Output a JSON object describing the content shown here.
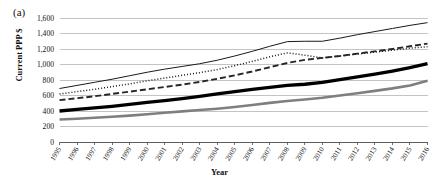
{
  "figure": {
    "panel_label": "(a)",
    "xlabel": "Year",
    "ylabel": "Current PPP $"
  },
  "chart_data": {
    "type": "line",
    "title": "",
    "subtitle": "",
    "panel": "(a)",
    "xlabel": "Year",
    "ylabel": "Current PPP $",
    "grid": true,
    "legend": "none",
    "xlim": [
      1995,
      2016
    ],
    "ylim": [
      0,
      1600
    ],
    "ytick_labels": [
      "0",
      "200",
      "400",
      "600",
      "800",
      "1,000",
      "1,200",
      "1,400",
      "1,600"
    ],
    "ytick_values": [
      0,
      200,
      400,
      600,
      800,
      1000,
      1200,
      1400,
      1600
    ],
    "x": [
      1995,
      1996,
      1997,
      1998,
      1999,
      2000,
      2001,
      2002,
      2003,
      2004,
      2005,
      2006,
      2007,
      2008,
      2009,
      2010,
      2011,
      2012,
      2013,
      2014,
      2015,
      2016
    ],
    "categories": [
      "1995",
      "1996",
      "1997",
      "1998",
      "1999",
      "2000",
      "2001",
      "2002",
      "2003",
      "2004",
      "2005",
      "2006",
      "2007",
      "2008",
      "2009",
      "2010",
      "2011",
      "2012",
      "2013",
      "2014",
      "2015",
      "2016"
    ],
    "series": [
      {
        "name": "series-1-thin-solid",
        "style": "thin-solid",
        "color": "#1a1a1a",
        "width": 1.0,
        "dash": "none",
        "values": [
          690,
          730,
          770,
          810,
          855,
          900,
          940,
          975,
          1010,
          1055,
          1110,
          1170,
          1235,
          1295,
          1300,
          1300,
          1340,
          1385,
          1425,
          1465,
          1505,
          1540
        ]
      },
      {
        "name": "series-2-dotted",
        "style": "dotted",
        "color": "#1a1a1a",
        "width": 1.5,
        "dash": "1,2",
        "values": [
          620,
          650,
          680,
          715,
          750,
          790,
          825,
          860,
          895,
          935,
          985,
          1040,
          1100,
          1150,
          1120,
          1085,
          1110,
          1135,
          1160,
          1185,
          1210,
          1230
        ]
      },
      {
        "name": "series-3-dashed",
        "style": "dashed",
        "color": "#262626",
        "width": 1.9,
        "dash": "6,3",
        "values": [
          540,
          565,
          590,
          620,
          650,
          680,
          710,
          740,
          775,
          815,
          860,
          910,
          965,
          1020,
          1060,
          1085,
          1110,
          1140,
          1170,
          1200,
          1235,
          1270
        ]
      },
      {
        "name": "series-4-thick-solid-black",
        "style": "thick-solid",
        "color": "#000000",
        "width": 3.3,
        "dash": "none",
        "values": [
          400,
          420,
          440,
          460,
          485,
          510,
          535,
          560,
          590,
          620,
          650,
          680,
          705,
          730,
          745,
          770,
          805,
          840,
          875,
          915,
          960,
          1010
        ]
      },
      {
        "name": "series-5-thick-solid-gray",
        "style": "thick-solid",
        "color": "#7f7f7f",
        "width": 2.6,
        "dash": "none",
        "values": [
          290,
          300,
          312,
          325,
          340,
          358,
          378,
          395,
          412,
          430,
          452,
          478,
          505,
          530,
          548,
          570,
          600,
          630,
          660,
          692,
          730,
          790
        ]
      }
    ]
  }
}
